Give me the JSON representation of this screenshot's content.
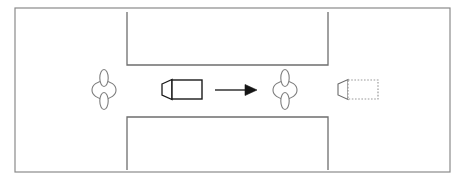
{
  "figure": {
    "type": "schematic-diagram",
    "title": "",
    "caption": "",
    "canvas": {
      "width": 468,
      "height": 182,
      "background": "#ffffff"
    }
  },
  "style": {
    "outer_border_color": "#8a8a8a",
    "obstacle_color": "#6e6e6e",
    "person_color": "#7d7d7d",
    "robot_color": "#1a1a1a",
    "ghost_robot_color": "#9a9a9a",
    "arrow_color": "#141414",
    "stroke_width_outer": 1.2,
    "stroke_width_obstacle": 1.3,
    "stroke_width_person": 1.1,
    "stroke_width_robot": 1.4
  },
  "environment": {
    "outer_boundary": {
      "label": "environment-boundary",
      "x": 15,
      "y": 8,
      "width": 435,
      "height": 164
    },
    "obstacles": [
      {
        "label": "upper-obstacle",
        "open_side": "top",
        "x": 127,
        "y": 12,
        "width": 201,
        "height": 53
      },
      {
        "label": "lower-obstacle",
        "open_side": "bottom",
        "x": 127,
        "y": 117,
        "width": 201,
        "height": 53
      }
    ],
    "corridor": {
      "label": "corridor-gap",
      "top_y": 65,
      "bottom_y": 117,
      "left_x": 127,
      "right_x": 328
    }
  },
  "agents": [
    {
      "id": "person-left",
      "label": "pedestrian",
      "role": "static-human",
      "cx": 104,
      "cy": 90,
      "body_rx": 12,
      "body_ry": 9,
      "limb_rx": 4,
      "limb_ry": 13,
      "style": "outline"
    },
    {
      "id": "person-right",
      "label": "pedestrian",
      "role": "static-human",
      "cx": 285,
      "cy": 90,
      "body_rx": 12,
      "body_ry": 9,
      "limb_rx": 4,
      "limb_ry": 13,
      "style": "outline"
    },
    {
      "id": "robot-start",
      "label": "robot",
      "role": "mobile-robot-current",
      "body": {
        "x": 172,
        "y": 80,
        "width": 30,
        "height": 19
      },
      "lens": {
        "x": 162,
        "y": 84,
        "width": 10,
        "height": 11
      },
      "heading": "right",
      "style": "solid"
    },
    {
      "id": "robot-goal",
      "label": "robot-goal",
      "role": "mobile-robot-target",
      "body": {
        "x": 348,
        "y": 80,
        "width": 30,
        "height": 19
      },
      "lens": {
        "x": 338,
        "y": 84,
        "width": 10,
        "height": 11
      },
      "heading": "right",
      "style": "dashed"
    }
  ],
  "annotations": [
    {
      "id": "motion-arrow",
      "label": "direction-of-travel",
      "type": "arrow",
      "x1": 215,
      "y1": 90,
      "x2": 257,
      "y2": 90,
      "head": "filled-triangle",
      "text": ""
    }
  ],
  "labels": {
    "person_left_name": "",
    "person_right_name": "",
    "robot_name": "",
    "goal_name": "",
    "arrow_name": ""
  }
}
